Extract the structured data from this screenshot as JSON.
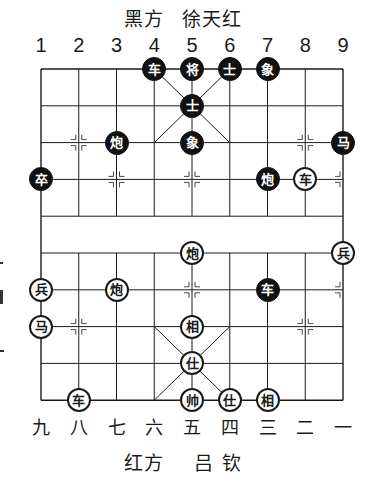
{
  "header": {
    "side": "黑方",
    "player": "徐天红"
  },
  "footer": {
    "side": "红方",
    "player": "吕 钦"
  },
  "columns_top": [
    "1",
    "2",
    "3",
    "4",
    "5",
    "6",
    "7",
    "8",
    "9"
  ],
  "columns_bottom": [
    "九",
    "八",
    "七",
    "六",
    "五",
    "四",
    "三",
    "二",
    "一"
  ],
  "board": {
    "origin_x": 41,
    "origin_y": 69,
    "col_step": 37.75,
    "row_step": 36.8,
    "line_color": "#1a1a1a",
    "river_rows": [
      4,
      5
    ]
  },
  "pieces": {
    "black": [
      {
        "label": "车",
        "col": 4,
        "row": 0
      },
      {
        "label": "将",
        "col": 5,
        "row": 0
      },
      {
        "label": "士",
        "col": 6,
        "row": 0
      },
      {
        "label": "象",
        "col": 7,
        "row": 0
      },
      {
        "label": "士",
        "col": 5,
        "row": 1
      },
      {
        "label": "炮",
        "col": 3,
        "row": 2
      },
      {
        "label": "象",
        "col": 5,
        "row": 2
      },
      {
        "label": "马",
        "col": 9,
        "row": 2
      },
      {
        "label": "卒",
        "col": 1,
        "row": 3
      },
      {
        "label": "炮",
        "col": 7,
        "row": 3
      },
      {
        "label": "车",
        "col": 7,
        "row": 6
      }
    ],
    "red": [
      {
        "label": "车",
        "col": 8,
        "row": 3
      },
      {
        "label": "炮",
        "col": 5,
        "row": 5
      },
      {
        "label": "兵",
        "col": 9,
        "row": 5
      },
      {
        "label": "兵",
        "col": 1,
        "row": 6
      },
      {
        "label": "炮",
        "col": 3,
        "row": 6
      },
      {
        "label": "马",
        "col": 1,
        "row": 7
      },
      {
        "label": "相",
        "col": 5,
        "row": 7
      },
      {
        "label": "仕",
        "col": 5,
        "row": 8
      },
      {
        "label": "车",
        "col": 2,
        "row": 9
      },
      {
        "label": "帅",
        "col": 5,
        "row": 9
      },
      {
        "label": "仕",
        "col": 6,
        "row": 9
      },
      {
        "label": "相",
        "col": 7,
        "row": 9
      }
    ]
  },
  "markers": [
    {
      "col": 2,
      "row": 2
    },
    {
      "col": 8,
      "row": 2
    },
    {
      "col": 3,
      "row": 3
    },
    {
      "col": 5,
      "row": 3
    },
    {
      "col": 9,
      "row": 3
    },
    {
      "col": 5,
      "row": 6
    },
    {
      "col": 9,
      "row": 6
    },
    {
      "col": 2,
      "row": 7
    },
    {
      "col": 8,
      "row": 7
    }
  ]
}
